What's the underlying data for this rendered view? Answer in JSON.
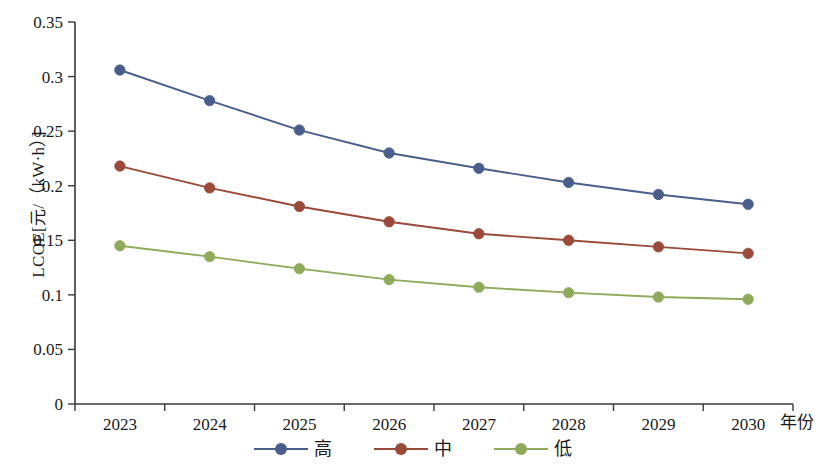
{
  "chart_data": {
    "type": "line",
    "title": "",
    "xlabel": "年份",
    "ylabel": "LCOE[元/（kW·h）]",
    "categories": [
      "2023",
      "2024",
      "2025",
      "2026",
      "2027",
      "2028",
      "2029",
      "2030"
    ],
    "series": [
      {
        "name": "高",
        "color": "#4a5e8c",
        "values": [
          0.306,
          0.278,
          0.251,
          0.23,
          0.216,
          0.203,
          0.192,
          0.183
        ]
      },
      {
        "name": "中",
        "color": "#9a4a38",
        "values": [
          0.218,
          0.198,
          0.181,
          0.167,
          0.156,
          0.15,
          0.144,
          0.138
        ]
      },
      {
        "name": "低",
        "color": "#8faa5a",
        "values": [
          0.145,
          0.135,
          0.124,
          0.114,
          0.107,
          0.102,
          0.098,
          0.096
        ]
      }
    ],
    "ylim": [
      0,
      0.35
    ],
    "yticks": [
      "0",
      "0.05",
      "0.1",
      "0.15",
      "0.2",
      "0.25",
      "0.3",
      "0.35"
    ],
    "ytick_values": [
      0,
      0.05,
      0.1,
      0.15,
      0.2,
      0.25,
      0.3,
      0.35
    ],
    "grid": false,
    "legend_position": "bottom",
    "axis_color": "#3a3a3a",
    "marker": "circle"
  },
  "legend": {
    "items": [
      {
        "label": "高",
        "color": "#4a5e8c"
      },
      {
        "label": "中",
        "color": "#9a4a38"
      },
      {
        "label": "低",
        "color": "#8faa5a"
      }
    ]
  }
}
